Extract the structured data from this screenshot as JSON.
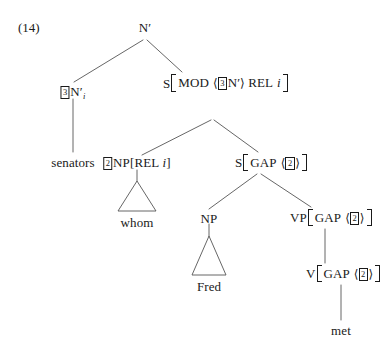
{
  "figure": {
    "example_number": "(14)",
    "type": "syntax-tree",
    "notation": "HPSG",
    "sentence_fragment": "senators whom Fred met"
  },
  "nodes": {
    "root": {
      "label": "N",
      "bar": "′"
    },
    "left_nbar": {
      "tag": "3",
      "label": "N",
      "bar": "′",
      "index": "i"
    },
    "s_mod": {
      "label": "S",
      "features": [
        {
          "attribute": "MOD",
          "value_open": "⟨",
          "value_tag": "3",
          "value_cat": "N′",
          "value_close": "⟩"
        },
        {
          "attribute": "REL",
          "value": "i"
        }
      ]
    },
    "senators": {
      "word": "senators"
    },
    "np_rel": {
      "tag": "2",
      "label": "NP",
      "bracket_open": "[",
      "attribute": "REL",
      "value": "i",
      "bracket_close": "]"
    },
    "whom": {
      "word": "whom"
    },
    "s_gap": {
      "label": "S",
      "attribute": "GAP",
      "value_open": "⟨",
      "value_tag": "2",
      "value_close": "⟩"
    },
    "np_subj": {
      "label": "NP"
    },
    "fred": {
      "word": "Fred"
    },
    "vp_gap": {
      "label": "VP",
      "attribute": "GAP",
      "value_open": "⟨",
      "value_tag": "2",
      "value_close": "⟩"
    },
    "v_gap": {
      "label": "V",
      "attribute": "GAP",
      "value_open": "⟨",
      "value_tag": "2",
      "value_close": "⟩"
    },
    "met": {
      "word": "met"
    }
  },
  "colors": {
    "ink": "#1a1a1a",
    "line": "#555555",
    "background": "#ffffff"
  }
}
